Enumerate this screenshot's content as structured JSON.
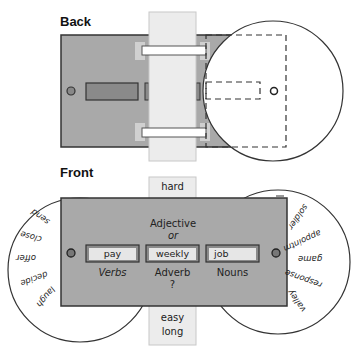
{
  "back": {
    "title": "Back"
  },
  "front": {
    "title": "Front",
    "strip_top_word": "hard",
    "strip_bottom_words": [
      "easy",
      "long"
    ],
    "header_line1": "Adjective",
    "header_line2": "or",
    "slots": [
      {
        "word": "pay",
        "label": "Verbs"
      },
      {
        "word": "weekly",
        "label": "Adverb"
      },
      {
        "word": "job",
        "label": "Nouns"
      }
    ],
    "question_mark": "?",
    "left_wheel_words": [
      "send",
      "close",
      "offer",
      "decide",
      "laugh"
    ],
    "right_wheel_words": [
      "soldier",
      "appointm",
      "game",
      "response",
      "valley"
    ]
  },
  "colors": {
    "panel": "#a9a9a9",
    "panel_border": "#3a3a3a",
    "strip": "#ececec",
    "slot_dark": "#8a8a8a",
    "slot_light": "#e6e6e6",
    "tab": "#cfcfcf"
  }
}
